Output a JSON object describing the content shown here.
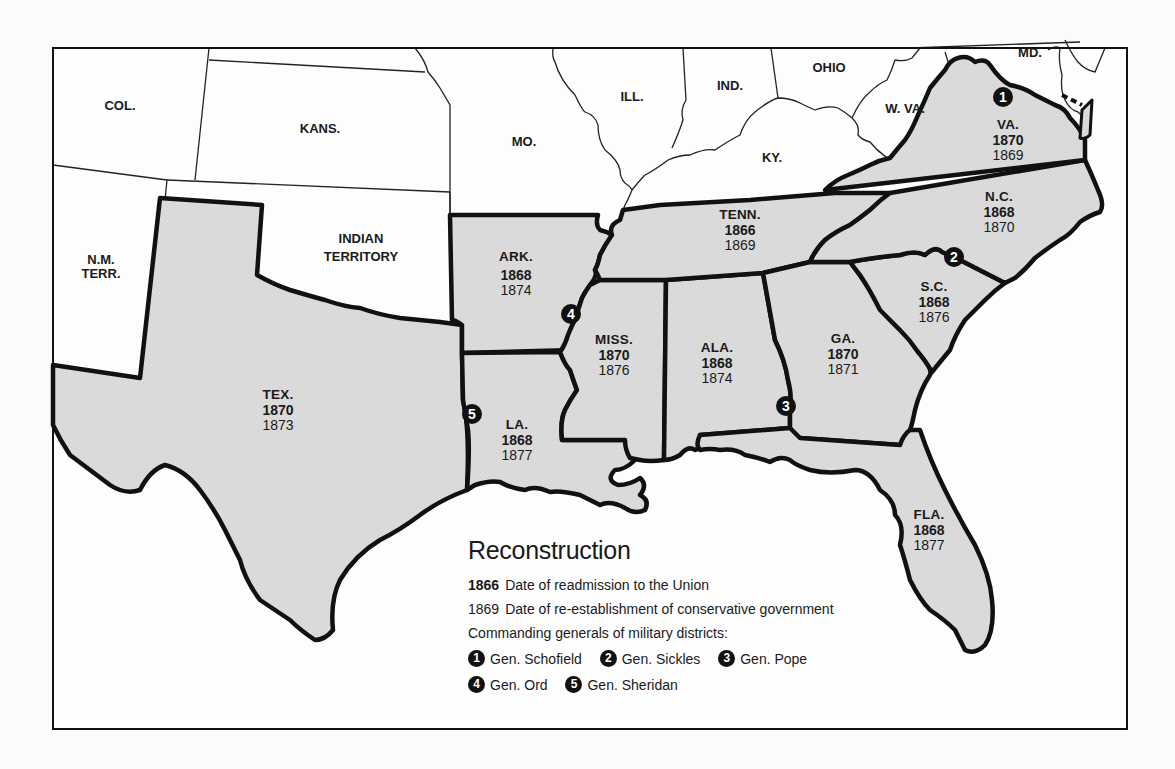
{
  "map": {
    "title": "Reconstruction",
    "colors": {
      "background": "#fbfbfa",
      "readmitted_fill": "#d9d9d9",
      "other_fill": "#ffffff",
      "confederate_border": "#111111",
      "marker": "#111111"
    },
    "other_states": [
      {
        "id": "col",
        "label": "COL."
      },
      {
        "id": "kans",
        "label": "KANS."
      },
      {
        "id": "mo",
        "label": "MO."
      },
      {
        "id": "ill",
        "label": "ILL."
      },
      {
        "id": "ind",
        "label": "IND."
      },
      {
        "id": "ohio",
        "label": "OHIO"
      },
      {
        "id": "ky",
        "label": "KY."
      },
      {
        "id": "wva",
        "label": "W. VA."
      },
      {
        "id": "md",
        "label": "MD."
      },
      {
        "id": "nm",
        "label_line1": "N.M.",
        "label_line2": "TERR."
      },
      {
        "id": "indian",
        "label_line1": "INDIAN",
        "label_line2": "TERRITORY"
      }
    ],
    "confederate_states": [
      {
        "id": "va",
        "label": "VA.",
        "readmitted": "1870",
        "conservative": "1869"
      },
      {
        "id": "nc",
        "label": "N.C.",
        "readmitted": "1868",
        "conservative": "1870"
      },
      {
        "id": "sc",
        "label": "S.C.",
        "readmitted": "1868",
        "conservative": "1876"
      },
      {
        "id": "ga",
        "label": "GA.",
        "readmitted": "1870",
        "conservative": "1871"
      },
      {
        "id": "fla",
        "label": "FLA.",
        "readmitted": "1868",
        "conservative": "1877"
      },
      {
        "id": "ala",
        "label": "ALA.",
        "readmitted": "1868",
        "conservative": "1874"
      },
      {
        "id": "miss",
        "label": "MISS.",
        "readmitted": "1870",
        "conservative": "1876"
      },
      {
        "id": "tenn",
        "label": "TENN.",
        "readmitted": "1866",
        "conservative": "1869"
      },
      {
        "id": "ark",
        "label": "ARK.",
        "readmitted": "1868",
        "conservative": "1874"
      },
      {
        "id": "la",
        "label": "LA.",
        "readmitted": "1868",
        "conservative": "1877"
      },
      {
        "id": "tex",
        "label": "TEX.",
        "readmitted": "1870",
        "conservative": "1873"
      }
    ],
    "district_markers": [
      {
        "number": "1",
        "location": "VA."
      },
      {
        "number": "2",
        "location": "S.C."
      },
      {
        "number": "3",
        "location": "GA."
      },
      {
        "number": "4",
        "location": "ARK./MISS."
      },
      {
        "number": "5",
        "location": "LA."
      }
    ]
  },
  "legend": {
    "title": "Reconstruction",
    "readmission": {
      "sample_year": "1866",
      "text": "Date of readmission to the Union"
    },
    "conservative": {
      "sample_year": "1869",
      "text": "Date of re-establishment of conservative government"
    },
    "generals_heading": "Commanding generals of military districts:",
    "generals": [
      {
        "number": "1",
        "name": "Gen. Schofield"
      },
      {
        "number": "2",
        "name": "Gen. Sickles"
      },
      {
        "number": "3",
        "name": "Gen. Pope"
      },
      {
        "number": "4",
        "name": "Gen. Ord"
      },
      {
        "number": "5",
        "name": "Gen. Sheridan"
      }
    ]
  }
}
